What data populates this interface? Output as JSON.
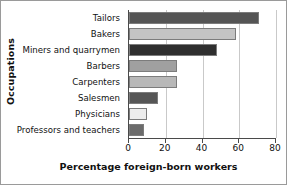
{
  "chart_data": {
    "type": "bar",
    "orientation": "horizontal",
    "title": "",
    "xlabel": "Percentage foreign-born workers",
    "ylabel": "Occupations",
    "categories": [
      "Tailors",
      "Bakers",
      "Miners and quarrymen",
      "Barbers",
      "Carpenters",
      "Salesmen",
      "Physicians",
      "Professors and teachers"
    ],
    "values": [
      71,
      58,
      48,
      26,
      26,
      16,
      10,
      8
    ],
    "bar_colors": [
      "#555555",
      "#c4c4c4",
      "#2f2f2f",
      "#a0a0a0",
      "#b8b8b8",
      "#565656",
      "#ededed",
      "#6b6b6b"
    ],
    "bar_edge_color": "#7c7c7c",
    "xlim": [
      0,
      80
    ],
    "xticks": [
      0,
      20,
      40,
      60,
      80
    ],
    "xticklabels": [
      "0",
      "20",
      "40",
      "60",
      "80"
    ],
    "grid": "vertical",
    "grid_color": "#c9c9c9",
    "legend": "none",
    "axis_color": "#4a4a4a",
    "frame_color": "#9a9a9a",
    "background": "#ffffff"
  }
}
